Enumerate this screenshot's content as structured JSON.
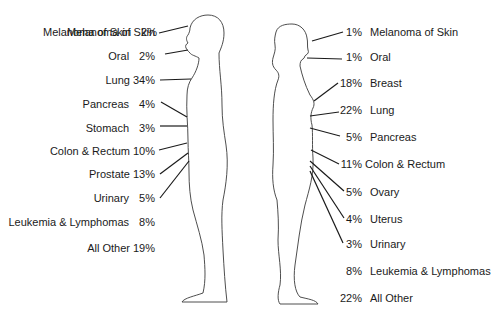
{
  "male": {
    "items": [
      {
        "name": "Melanoma of Skin",
        "pct": "2%",
        "y": 32
      },
      {
        "name": "Oral",
        "pct": "2%",
        "y": 56
      },
      {
        "name": "Lung",
        "pct": "34%",
        "y": 80
      },
      {
        "name": "Pancreas",
        "pct": "4%",
        "y": 104
      },
      {
        "name": "Stomach",
        "pct": "3%",
        "y": 128
      },
      {
        "name": "Colon & Rectum",
        "pct": "10%",
        "y": 151
      },
      {
        "name": "Prostate",
        "pct": "13%",
        "y": 174
      },
      {
        "name": "Urinary",
        "pct": "5%",
        "y": 198
      },
      {
        "name": "Leukemia & Lymphomas",
        "pct": "8%",
        "y": 222
      },
      {
        "name": "All Other",
        "pct": "19%",
        "y": 248
      }
    ]
  },
  "female": {
    "items": [
      {
        "pct": "1%",
        "name": "Melanoma of Skin",
        "y": 32
      },
      {
        "pct": "1%",
        "name": "Oral",
        "y": 57
      },
      {
        "pct": "18%",
        "name": "Breast",
        "y": 84
      },
      {
        "pct": "22%",
        "name": "Lung",
        "y": 111
      },
      {
        "pct": "5%",
        "name": "Pancreas",
        "y": 138
      },
      {
        "pct": "11%",
        "name": "Colon & Rectum",
        "y": 164
      },
      {
        "pct": "5%",
        "name": "Ovary",
        "y": 192
      },
      {
        "pct": "4%",
        "name": "Uterus",
        "y": 220
      },
      {
        "pct": "3%",
        "name": "Urinary",
        "y": 245
      },
      {
        "pct": "8%",
        "name": "Leukemia & Lymphomas",
        "y": 271
      },
      {
        "pct": "22%",
        "name": "All Other",
        "y": 298
      }
    ]
  },
  "colors": {
    "line": "#1a1a1a",
    "outline": "#3a3a3a",
    "background": "#ffffff"
  }
}
